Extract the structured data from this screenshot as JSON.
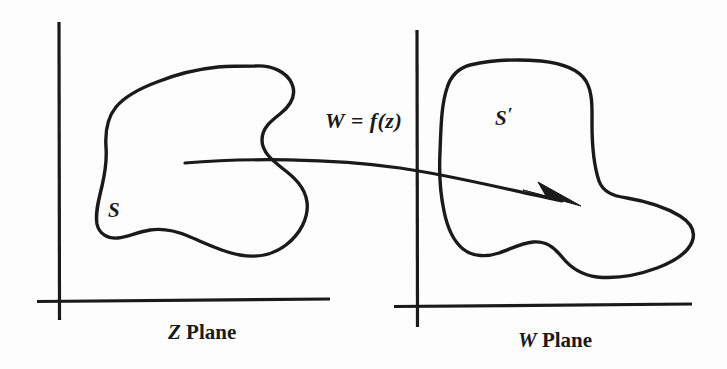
{
  "figure": {
    "background_color": "#fdfdfd",
    "ink_color": "#1a1a1a",
    "width": 727,
    "height": 369
  },
  "left_panel": {
    "name": "Z plane",
    "axis_label_symbol": "Z",
    "axis_label_word": "Plane",
    "region_label": "S",
    "axes": {
      "origin_x": 59,
      "origin_y": 301,
      "vertical_top_y": 22,
      "vertical_bottom_y": 320,
      "horizontal_left_x": 37,
      "horizontal_right_x": 330
    }
  },
  "right_panel": {
    "name": "W plane",
    "axis_label_symbol": "W",
    "axis_label_word": "Plane",
    "region_label": "S",
    "region_label_prime": "′",
    "axes": {
      "origin_x": 417,
      "origin_y": 306,
      "vertical_top_y": 30,
      "vertical_bottom_y": 327,
      "horizontal_left_x": 394,
      "horizontal_right_x": 692
    }
  },
  "mapping_arrow": {
    "label": "W = f(z)",
    "start_x": 185,
    "start_y": 163,
    "tip_x": 581,
    "tip_y": 206
  }
}
